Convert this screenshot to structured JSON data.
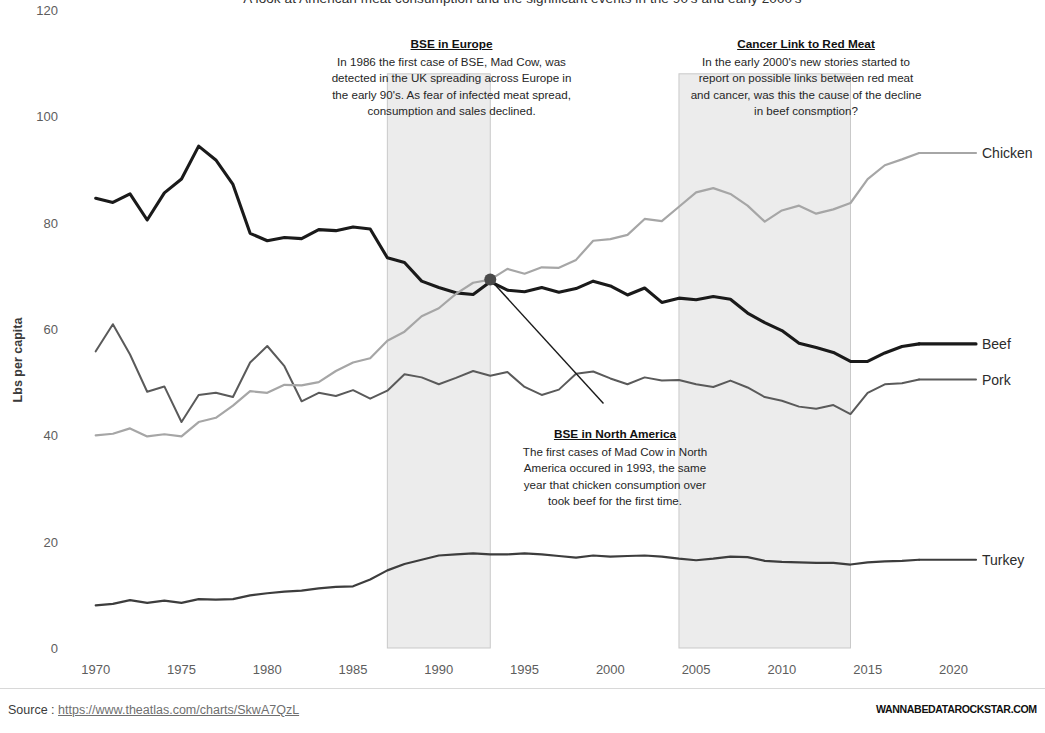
{
  "title": "A look at American meat consumption and the significant events in the 90's and early 2000's",
  "footer": {
    "source_prefix": "Source : ",
    "source_url": "https://www.theatlas.com/charts/SkwA7QzL",
    "watermark": "WANNABEDATAROCKSTAR.COM"
  },
  "annotations": [
    {
      "id": "bse-europe",
      "title": "BSE in Europe",
      "body": "In 1986 the first case of BSE, Mad Cow, was detected in the UK spreading across Europe in the early 90's. As fear of infected meat spread, consumption and sales declined."
    },
    {
      "id": "cancer-red-meat",
      "title": "Cancer Link to Red Meat",
      "body": "In the early 2000's new stories started to report on possible links between red meat and cancer, was this the cause of the decline in beef consmption?"
    },
    {
      "id": "bse-north-america",
      "title": "BSE in North America",
      "body": "The first cases of Mad Cow in North America occured in 1993, the same year that chicken consumption over took beef for the first time."
    }
  ],
  "chart_data": {
    "type": "line",
    "title": "A look at American meat consumption and the significant events in the 90's and early 2000's",
    "xlabel": "",
    "ylabel": "Lbs per capita",
    "xlim": [
      1968.5,
      2020.5
    ],
    "ylim": [
      0,
      120
    ],
    "xticks": [
      1970,
      1975,
      1980,
      1985,
      1990,
      1995,
      2000,
      2005,
      2010,
      2015,
      2020
    ],
    "yticks": [
      0,
      20,
      40,
      60,
      80,
      100,
      120
    ],
    "grid": false,
    "legend_position": "right-inline",
    "x": [
      1970,
      1971,
      1972,
      1973,
      1974,
      1975,
      1976,
      1977,
      1978,
      1979,
      1980,
      1981,
      1982,
      1983,
      1984,
      1985,
      1986,
      1987,
      1988,
      1989,
      1990,
      1991,
      1992,
      1993,
      1994,
      1995,
      1996,
      1997,
      1998,
      1999,
      2000,
      2001,
      2002,
      2003,
      2004,
      2005,
      2006,
      2007,
      2008,
      2009,
      2010,
      2011,
      2012,
      2013,
      2014,
      2015,
      2016,
      2017,
      2018
    ],
    "series": [
      {
        "name": "Beef",
        "color": "#1a1a1a",
        "values": [
          84.6,
          83.8,
          85.4,
          80.5,
          85.6,
          88.2,
          94.4,
          91.8,
          87.2,
          78.0,
          76.6,
          77.2,
          77.0,
          78.7,
          78.5,
          79.2,
          78.8,
          73.4,
          72.5,
          69.0,
          67.8,
          66.8,
          66.5,
          68.9,
          67.3,
          67.0,
          67.8,
          66.9,
          67.6,
          69.0,
          68.1,
          66.4,
          67.7,
          65.0,
          65.8,
          65.5,
          66.1,
          65.6,
          63.0,
          61.2,
          59.7,
          57.3,
          56.5,
          55.6,
          53.9,
          53.9,
          55.5,
          56.7,
          57.2
        ]
      },
      {
        "name": "Pork",
        "color": "#5a5a5a",
        "values": [
          55.8,
          60.9,
          55.2,
          48.2,
          49.2,
          42.5,
          47.6,
          48.0,
          47.2,
          53.7,
          56.8,
          53.0,
          46.4,
          48.0,
          47.4,
          48.5,
          46.9,
          48.4,
          51.5,
          50.9,
          49.6,
          50.8,
          52.1,
          51.2,
          51.9,
          49.1,
          47.6,
          48.6,
          51.6,
          52.0,
          50.7,
          49.6,
          50.9,
          50.3,
          50.4,
          49.6,
          49.1,
          50.3,
          49.0,
          47.2,
          46.5,
          45.4,
          45.0,
          45.7,
          44.0,
          48.0,
          49.6,
          49.8,
          50.5
        ]
      },
      {
        "name": "Chicken",
        "color": "#a6a6a6",
        "values": [
          40.0,
          40.3,
          41.3,
          39.8,
          40.2,
          39.8,
          42.5,
          43.3,
          45.6,
          48.3,
          48.0,
          49.5,
          49.4,
          50.0,
          52.1,
          53.7,
          54.5,
          57.8,
          59.5,
          62.4,
          63.9,
          66.6,
          68.7,
          69.3,
          71.3,
          70.4,
          71.6,
          71.5,
          73.0,
          76.6,
          76.9,
          77.7,
          80.7,
          80.3,
          83.0,
          85.7,
          86.5,
          85.4,
          83.2,
          80.2,
          82.3,
          83.2,
          81.7,
          82.5,
          83.7,
          88.2,
          90.8,
          91.9,
          93.1
        ]
      },
      {
        "name": "Turkey",
        "color": "#3d3d3d",
        "values": [
          8.0,
          8.3,
          9.0,
          8.5,
          8.9,
          8.5,
          9.2,
          9.1,
          9.2,
          9.9,
          10.3,
          10.6,
          10.8,
          11.2,
          11.5,
          11.6,
          12.9,
          14.6,
          15.8,
          16.6,
          17.4,
          17.6,
          17.8,
          17.6,
          17.6,
          17.8,
          17.6,
          17.3,
          17.0,
          17.4,
          17.2,
          17.3,
          17.4,
          17.2,
          16.8,
          16.5,
          16.8,
          17.2,
          17.1,
          16.4,
          16.2,
          16.1,
          16.0,
          16.0,
          15.7,
          16.1,
          16.3,
          16.4,
          16.6
        ]
      }
    ],
    "shaded_bands": [
      {
        "label": "bse-europe-band",
        "x0": 1987,
        "x1": 1993,
        "color": "#ececec"
      },
      {
        "label": "cancer-band",
        "x0": 2004,
        "x1": 2014,
        "color": "#ececec"
      }
    ],
    "markers": [
      {
        "label": "chicken-overtakes-beef",
        "x": 1993,
        "y": 69.3,
        "color": "#4a4a4a"
      }
    ],
    "leader_lines": [
      {
        "label": "bse-na-leader",
        "x0": 1993,
        "y0": 69.3,
        "x1": 1999.6,
        "y1": 46.0
      }
    ]
  }
}
